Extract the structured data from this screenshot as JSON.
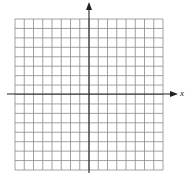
{
  "diagram": {
    "type": "coordinate-grid",
    "columns": 16,
    "rows": 16,
    "axes": {
      "x_label": "x",
      "y_label": "y"
    },
    "colors": {
      "grid": "#8a8a8a",
      "axis": "#222222",
      "background": "#ffffff"
    }
  }
}
